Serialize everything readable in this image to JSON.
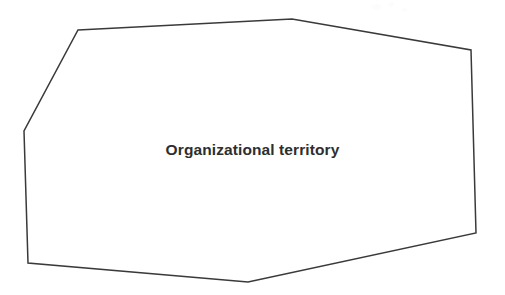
{
  "figure": {
    "type": "diagram",
    "background_color": "#ffffff",
    "shape": {
      "name": "organizational-territory-polygon",
      "kind": "polygon",
      "sides": 7,
      "stroke_color": "#3a3a3a",
      "fill_color": "#ffffff",
      "stroke_width": 1.5,
      "vertices": [
        {
          "x": 78,
          "y": 30
        },
        {
          "x": 292,
          "y": 19
        },
        {
          "x": 471,
          "y": 50
        },
        {
          "x": 476,
          "y": 233
        },
        {
          "x": 248,
          "y": 282
        },
        {
          "x": 28,
          "y": 263
        },
        {
          "x": 24,
          "y": 131
        }
      ],
      "points_attr": "78,30 292,19 471,50 476,233 248,282 28,263 24,131"
    },
    "label": {
      "text": "Organizational territory",
      "color": "#2e2e2e",
      "font_size_px": 15.5,
      "font_weight": "bold",
      "center_x": 245,
      "center_y": 150
    }
  }
}
